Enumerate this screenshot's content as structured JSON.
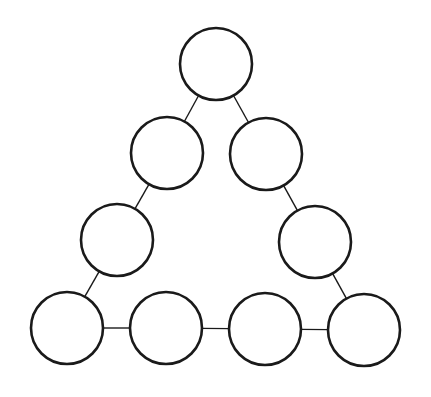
{
  "diagram": {
    "type": "triangle-node-graph",
    "style": {
      "stroke": "#1a1a1a",
      "fill": "#ffffff",
      "background": "#ffffff",
      "radius": 36
    },
    "nodes": [
      {
        "id": "n1",
        "cx": 216,
        "cy": 64,
        "label": ""
      },
      {
        "id": "n2",
        "cx": 167,
        "cy": 153,
        "label": ""
      },
      {
        "id": "n3",
        "cx": 266,
        "cy": 154,
        "label": ""
      },
      {
        "id": "n4",
        "cx": 117,
        "cy": 240,
        "label": ""
      },
      {
        "id": "n5",
        "cx": 315,
        "cy": 242,
        "label": ""
      },
      {
        "id": "n6",
        "cx": 67,
        "cy": 328,
        "label": ""
      },
      {
        "id": "n7",
        "cx": 166,
        "cy": 328,
        "label": ""
      },
      {
        "id": "n8",
        "cx": 265,
        "cy": 329,
        "label": ""
      },
      {
        "id": "n9",
        "cx": 364,
        "cy": 330,
        "label": ""
      }
    ],
    "edges": [
      [
        "n1",
        "n2"
      ],
      [
        "n2",
        "n4"
      ],
      [
        "n4",
        "n6"
      ],
      [
        "n1",
        "n3"
      ],
      [
        "n3",
        "n5"
      ],
      [
        "n5",
        "n9"
      ],
      [
        "n6",
        "n7"
      ],
      [
        "n7",
        "n8"
      ],
      [
        "n8",
        "n9"
      ]
    ]
  }
}
